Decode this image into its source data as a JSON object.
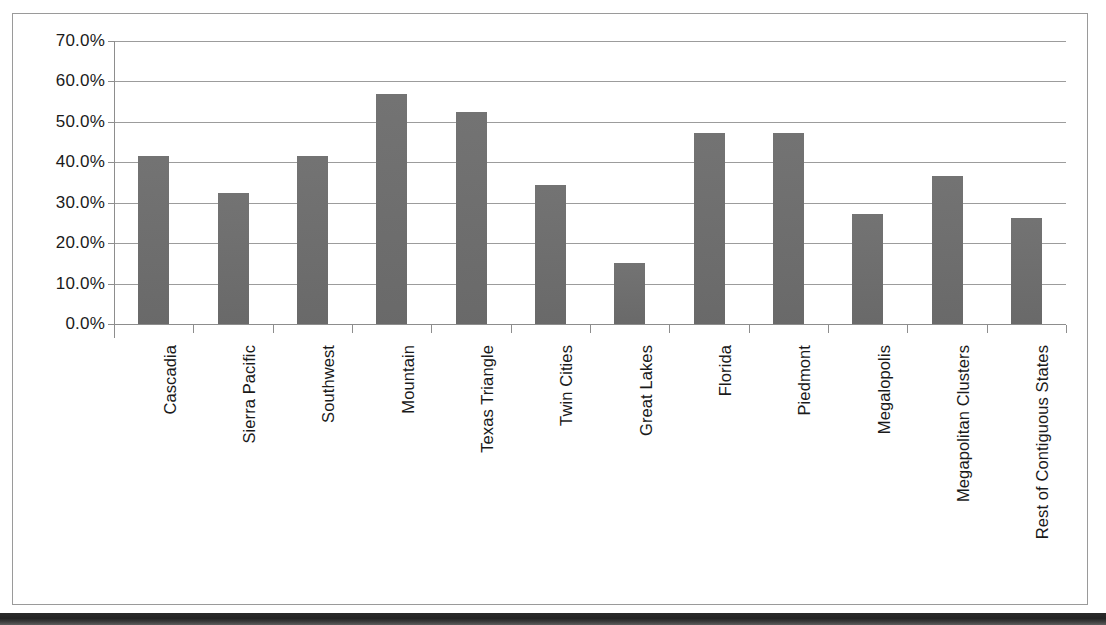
{
  "chart_data": {
    "type": "bar",
    "title": "",
    "subtitle": "",
    "xlabel": "",
    "ylabel": "",
    "ylim": [
      0,
      70
    ],
    "ytick_labels": [
      "70.0%",
      "60.0%",
      "50.0%",
      "40.0%",
      "30.0%",
      "20.0%",
      "10.0%",
      "0.0%"
    ],
    "ytick_values": [
      70,
      60,
      50,
      40,
      30,
      20,
      10,
      0
    ],
    "grid": "horizontal",
    "legend": "none",
    "bar_color": "#6e6e6e",
    "categories": [
      "Cascadia",
      "Sierra Pacific",
      "Southwest",
      "Mountain",
      "Texas Triangle",
      "Twin Cities",
      "Great Lakes",
      "Florida",
      "Piedmont",
      "Megalopolis",
      "Megapolitan Clusters",
      "Rest of Contiguous States"
    ],
    "values": [
      41.6,
      32.3,
      41.6,
      57.0,
      52.4,
      34.5,
      15.1,
      47.2,
      47.2,
      27.1,
      36.7,
      26.1
    ]
  },
  "axes": {
    "y_axis_name": "percent-axis",
    "x_axis_name": "region-axis"
  }
}
